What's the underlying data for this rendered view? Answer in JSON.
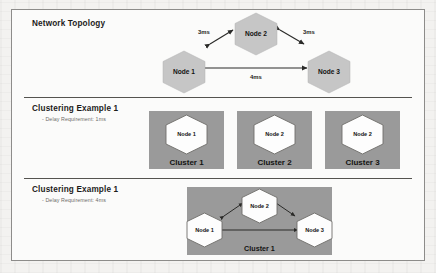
{
  "figure": {
    "panels": [
      {
        "id": "network-topology",
        "title": "Network Topology",
        "subtitle": "",
        "nodes": [
          {
            "label": "Node 1"
          },
          {
            "label": "Node 2"
          },
          {
            "label": "Node 3"
          }
        ],
        "links": [
          {
            "from": "Node 1",
            "to": "Node 2",
            "delay": "3ms"
          },
          {
            "from": "Node 2",
            "to": "Node 3",
            "delay": "3ms"
          },
          {
            "from": "Node 1",
            "to": "Node 3",
            "delay": "4ms"
          }
        ]
      },
      {
        "id": "clustering-example-a",
        "title": "Clustering Example 1",
        "subtitle": "- Delay Requirement: 1ms",
        "clusters": [
          {
            "name": "Cluster 1",
            "node": "Node 1"
          },
          {
            "name": "Cluster 2",
            "node": "Node 2"
          },
          {
            "name": "Cluster 3",
            "node": "Node 2"
          }
        ]
      },
      {
        "id": "clustering-example-b",
        "title": "Clustering Example 1",
        "subtitle": "- Delay Requirement: 4ms",
        "clusters": [
          {
            "name": "Cluster 1",
            "nodes": [
              {
                "label": "Node 1"
              },
              {
                "label": "Node 2"
              },
              {
                "label": "Node 3"
              }
            ]
          }
        ]
      }
    ]
  },
  "colors": {
    "frame_border": "#8d8c8a",
    "panel_divider": "#54534f",
    "topology_node_fill": "#c6c6c6",
    "cluster_box_fill": "#9a9a9a",
    "cluster_node_fill": "#fdfdfd",
    "link_stroke": "#2a2a28",
    "title_text": "#1d1c1a",
    "subtitle_text": "#6e6c68",
    "page_background": "#f3f2f0",
    "figure_background": "#fbfbfa"
  }
}
